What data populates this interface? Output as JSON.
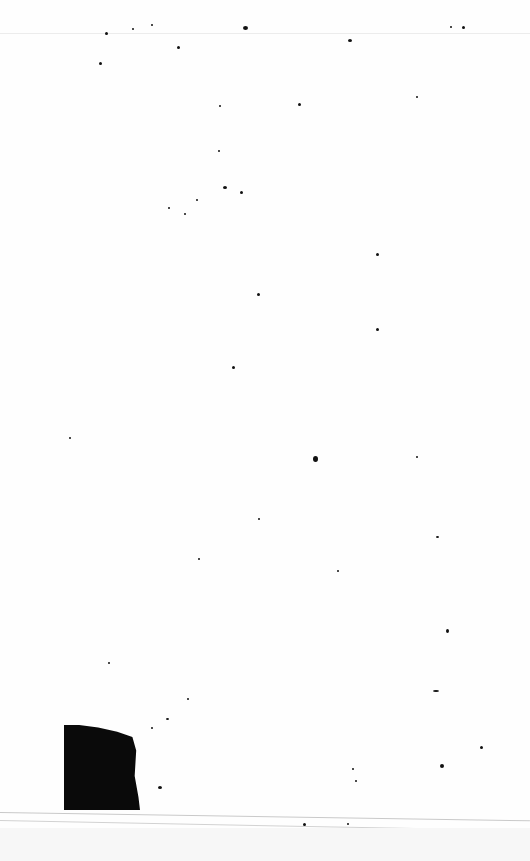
{
  "page": {
    "type": "blank scanned page",
    "background_color": "#fefefe",
    "mark_color": "#0a0a0a"
  },
  "specks": [
    [
      105,
      32,
      3,
      3
    ],
    [
      132,
      28,
      2,
      2
    ],
    [
      151,
      24,
      2,
      2
    ],
    [
      243,
      26,
      5,
      4
    ],
    [
      348,
      39,
      4,
      3
    ],
    [
      450,
      26,
      2,
      2
    ],
    [
      462,
      26,
      3,
      3
    ],
    [
      177,
      46,
      3,
      3
    ],
    [
      99,
      62,
      3,
      3
    ],
    [
      219,
      105,
      2,
      2
    ],
    [
      298,
      103,
      3,
      3
    ],
    [
      416,
      96,
      2,
      2
    ],
    [
      218,
      150,
      2,
      2
    ],
    [
      223,
      186,
      4,
      3
    ],
    [
      240,
      191,
      3,
      3
    ],
    [
      196,
      199,
      2,
      2
    ],
    [
      168,
      207,
      2,
      2
    ],
    [
      184,
      213,
      2,
      2
    ],
    [
      376,
      253,
      3,
      3
    ],
    [
      257,
      293,
      3,
      3
    ],
    [
      376,
      328,
      3,
      3
    ],
    [
      232,
      366,
      3,
      3
    ],
    [
      69,
      437,
      2,
      2
    ],
    [
      313,
      456,
      5,
      6
    ],
    [
      416,
      456,
      2,
      2
    ],
    [
      258,
      518,
      2,
      2
    ],
    [
      436,
      536,
      3,
      2
    ],
    [
      198,
      558,
      2,
      2
    ],
    [
      337,
      570,
      2,
      2
    ],
    [
      446,
      629,
      3,
      4
    ],
    [
      108,
      662,
      2,
      2
    ],
    [
      433,
      690,
      6,
      2
    ],
    [
      187,
      698,
      2,
      2
    ],
    [
      166,
      718,
      3,
      2
    ],
    [
      151,
      727,
      2,
      2
    ],
    [
      158,
      786,
      4,
      3
    ],
    [
      480,
      746,
      3,
      3
    ],
    [
      440,
      764,
      4,
      4
    ],
    [
      352,
      768,
      2,
      2
    ],
    [
      355,
      780,
      2,
      2
    ],
    [
      303,
      823,
      3,
      3
    ],
    [
      347,
      823,
      2,
      2
    ]
  ]
}
